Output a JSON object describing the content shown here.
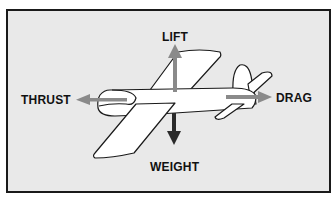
{
  "diagram": {
    "labels": {
      "lift": "LIFT",
      "thrust": "THRUST",
      "drag": "DRAG",
      "weight": "WEIGHT"
    },
    "colors": {
      "background": "#e9e9e9",
      "border": "#1a1a1a",
      "airplane_fill": "#ffffff",
      "airplane_outline": "#1a1a1a",
      "lift_arrow": "#8a8a8a",
      "thrust_arrow": "#8a8a8a",
      "drag_arrow": "#8a8a8a",
      "weight_arrow": "#2a2a2a"
    },
    "forces": [
      {
        "name": "lift",
        "direction": "up"
      },
      {
        "name": "weight",
        "direction": "down"
      },
      {
        "name": "thrust",
        "direction": "left"
      },
      {
        "name": "drag",
        "direction": "right"
      }
    ]
  }
}
